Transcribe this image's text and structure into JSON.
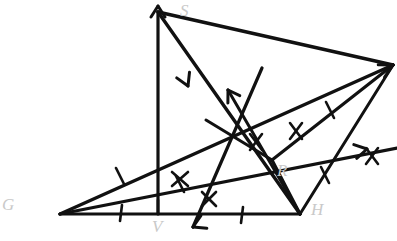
{
  "figure": {
    "canvas": {
      "width": 397,
      "height": 241
    },
    "stroke_color": "#111111",
    "label_color": "#c9c9c9",
    "background": "#ffffff",
    "vertices": [
      {
        "id": "S",
        "label": "S",
        "x": 158,
        "y": 12,
        "label_x": 180,
        "label_y": 4
      },
      {
        "id": "G",
        "label": "G",
        "x": 60,
        "y": 214,
        "label_x": 2,
        "label_y": 198
      },
      {
        "id": "H",
        "label": "H",
        "x": 300,
        "y": 214,
        "label_x": 311,
        "label_y": 202
      },
      {
        "id": "R",
        "label": "R",
        "x": 272,
        "y": 160,
        "label_x": 277,
        "label_y": 163
      },
      {
        "id": "V",
        "label": "V",
        "x": 158,
        "y": 214,
        "label_x": 152,
        "label_y": 218
      },
      {
        "id": "E",
        "label": "",
        "x": 393,
        "y": 65,
        "label_x": 386,
        "label_y": 58
      }
    ],
    "segments": [
      {
        "name": "baseline-G-H",
        "from": "G",
        "to": "H",
        "ticks": 0
      },
      {
        "name": "altitude-S-V",
        "from": "S",
        "to": "V",
        "ticks": 0
      },
      {
        "name": "side-S-to-right",
        "from": "S",
        "to": "E",
        "ticks": 0
      },
      {
        "name": "ray-G-upper",
        "from": "G",
        "to": "E",
        "ticks": 1
      },
      {
        "name": "ray-G-mid",
        "from": "G",
        "to": "R",
        "ticks": 1
      },
      {
        "name": "median-S-H",
        "from": "S",
        "to": "H",
        "ticks": 0
      },
      {
        "name": "segment-R-E",
        "from": "R",
        "to": "E",
        "ticks": 1
      },
      {
        "name": "segment-R-H",
        "from": "R",
        "to": "H",
        "ticks": 0
      }
    ],
    "arrow_markers": [
      {
        "name": "arrow-up-at-S",
        "x": 158,
        "y": 6,
        "angle": -90
      },
      {
        "name": "arrow-up-left-center",
        "x": 228,
        "y": 90,
        "angle": -125
      },
      {
        "name": "arrow-down-left-baseline",
        "x": 193,
        "y": 227,
        "angle": 140
      },
      {
        "name": "arrow-right-edge",
        "x": 366,
        "y": 149,
        "angle": -25
      },
      {
        "name": "arrow-down-on-S-V",
        "x": 186,
        "y": 82,
        "angle": 62
      }
    ],
    "tick_marks": [
      {
        "name": "tick-baseline-left",
        "x": 122,
        "y": 213,
        "angle": 78
      },
      {
        "name": "tick-baseline-mid",
        "x": 158,
        "y": 207,
        "angle": 90
      },
      {
        "name": "tick-baseline-right",
        "x": 243,
        "y": 216,
        "angle": 78
      },
      {
        "name": "tick-G-upper-ray",
        "x": 120,
        "y": 176,
        "angle": 70
      },
      {
        "name": "tick-G-mid-ray",
        "x": 180,
        "y": 184,
        "angle": 62
      },
      {
        "name": "tick-R-H",
        "x": 325,
        "y": 175,
        "angle": 62
      },
      {
        "name": "tick-S-E-upper",
        "x": 330,
        "y": 110,
        "angle": 62
      },
      {
        "name": "tick-cross-center-a",
        "x": 256,
        "y": 142,
        "angle": 60
      },
      {
        "name": "tick-cross-center-b",
        "x": 296,
        "y": 131,
        "angle": 60
      },
      {
        "name": "tick-cross-right",
        "x": 372,
        "y": 156,
        "angle": 60
      }
    ]
  }
}
